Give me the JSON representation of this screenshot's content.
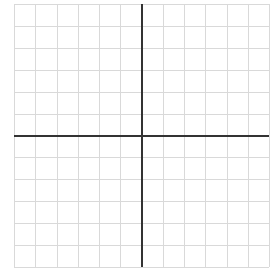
{
  "graph": {
    "type": "coordinate-grid",
    "columns": 12,
    "rows": 12,
    "origin_column_index": 6,
    "origin_row_index": 6,
    "bounds": {
      "left": 14,
      "top": 4,
      "right": 269,
      "bottom": 267
    },
    "colors": {
      "background": "#ffffff",
      "grid_line": "#d9d9d9",
      "axis_line": "#333333"
    },
    "grid_line_width": 1,
    "axis_line_width": 2,
    "labels": []
  }
}
